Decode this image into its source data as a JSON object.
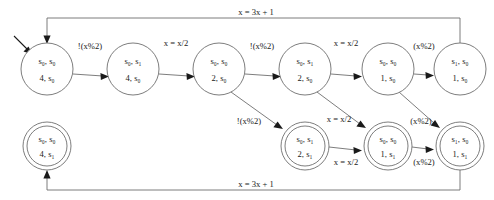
{
  "diagram": {
    "type": "finite-state-machine",
    "colors": {
      "edge": "#6e6e6e",
      "node_stroke": "#6e6e6e",
      "text": "#1a1a1a",
      "background": "#ffffff",
      "arrow": "#1a1a1a"
    },
    "states": [
      {
        "id": "n1",
        "line1": "s₀, s₀",
        "line2": "4, s₀",
        "accepting": false,
        "initial": true,
        "row": "top",
        "cx": 47,
        "cy": 69,
        "r": 26
      },
      {
        "id": "n2",
        "line1": "s₀, s₁",
        "line2": "4, s₀",
        "accepting": false,
        "initial": false,
        "row": "top",
        "cx": 133,
        "cy": 69,
        "r": 26
      },
      {
        "id": "n3",
        "line1": "s₀, s₀",
        "line2": "2, s₀",
        "accepting": false,
        "initial": false,
        "row": "top",
        "cx": 219,
        "cy": 69,
        "r": 26
      },
      {
        "id": "n4",
        "line1": "s₀, s₁",
        "line2": "2, s₀",
        "accepting": false,
        "initial": false,
        "row": "top",
        "cx": 305,
        "cy": 69,
        "r": 26
      },
      {
        "id": "n5",
        "line1": "s₀, s₀",
        "line2": "1, s₀",
        "accepting": false,
        "initial": false,
        "row": "top",
        "cx": 388,
        "cy": 69,
        "r": 26
      },
      {
        "id": "n6",
        "line1": "s₁, s₀",
        "line2": "1, s₀",
        "accepting": false,
        "initial": false,
        "row": "top",
        "cx": 460,
        "cy": 69,
        "r": 26
      },
      {
        "id": "m1",
        "line1": "s₀, s₀",
        "line2": "4, s₁",
        "accepting": true,
        "initial": false,
        "row": "bottom",
        "cx": 47,
        "cy": 146,
        "r": 24
      },
      {
        "id": "m4",
        "line1": "s₀, s₁",
        "line2": "2, s₁",
        "accepting": true,
        "initial": false,
        "row": "bottom",
        "cx": 305,
        "cy": 146,
        "r": 24
      },
      {
        "id": "m5",
        "line1": "s₀, s₀",
        "line2": "1, s₁",
        "accepting": true,
        "initial": false,
        "row": "bottom",
        "cx": 388,
        "cy": 146,
        "r": 24
      },
      {
        "id": "m6",
        "line1": "s₁, s₀",
        "line2": "1, s₁",
        "accepting": true,
        "initial": false,
        "row": "bottom",
        "cx": 460,
        "cy": 146,
        "r": 24
      }
    ],
    "transitions": [
      {
        "id": "t1",
        "from": "n1",
        "to": "n2",
        "label": "!(x%2)",
        "label_x": 90,
        "label_y": 47
      },
      {
        "id": "t2",
        "from": "n2",
        "to": "n3",
        "label": "x = x/2",
        "label_x": 176,
        "label_y": 44
      },
      {
        "id": "t3",
        "from": "n3",
        "to": "n4",
        "label": "!(x%2)",
        "label_x": 262,
        "label_y": 47
      },
      {
        "id": "t4",
        "from": "n4",
        "to": "n5",
        "label": "x = x/2",
        "label_x": 346,
        "label_y": 44
      },
      {
        "id": "t5",
        "from": "n5",
        "to": "n6",
        "label": "(x%2)",
        "label_x": 424,
        "label_y": 47
      },
      {
        "id": "t6",
        "from": "n3",
        "to": "m4",
        "label": "!(x%2)",
        "label_x": 249,
        "label_y": 122
      },
      {
        "id": "t7",
        "from": "n4",
        "to": "m5",
        "label": "x = x/2",
        "label_x": 339,
        "label_y": 120
      },
      {
        "id": "t8",
        "from": "n5",
        "to": "m6",
        "label": "(x%2)",
        "label_x": 421,
        "label_y": 122
      },
      {
        "id": "t9",
        "from": "m4",
        "to": "m5",
        "label": "x = x/2",
        "label_x": 346,
        "label_y": 163
      },
      {
        "id": "t10",
        "from": "m5",
        "to": "m6",
        "label": "(x%2)",
        "label_x": 424,
        "label_y": 163
      },
      {
        "id": "t11",
        "from": "n6",
        "to": "n1",
        "label": "x = 3x + 1",
        "label_x": 256,
        "label_y": 13
      },
      {
        "id": "t12",
        "from": "m6",
        "to": "m1",
        "label": "x = 3x + 1",
        "label_x": 256,
        "label_y": 185
      }
    ]
  }
}
